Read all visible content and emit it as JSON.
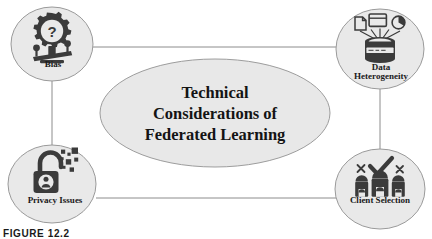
{
  "figure": {
    "caption": "FIGURE 12.2",
    "center": {
      "line1": "Technical",
      "line2": "Considerations of",
      "line3": "Federated Learning"
    },
    "nodes": [
      {
        "id": "bias",
        "label": "Bias",
        "icon": "gear-question-balance-scale-icon"
      },
      {
        "id": "data-heterogeneity",
        "label": "Data\nHeterogeneity",
        "icon": "database-documents-icon"
      },
      {
        "id": "privacy-issues",
        "label": "Privacy Issues",
        "icon": "open-padlock-pixels-icon"
      },
      {
        "id": "client-selection",
        "label": "Client Selection",
        "icon": "people-check-cross-icon"
      }
    ],
    "connections": [
      {
        "from": "bias",
        "to": "data-heterogeneity"
      },
      {
        "from": "bias",
        "to": "privacy-issues"
      },
      {
        "from": "data-heterogeneity",
        "to": "client-selection"
      },
      {
        "from": "privacy-issues",
        "to": "client-selection"
      }
    ],
    "colors": {
      "node_fill": "#e9e9e9",
      "node_stroke": "#9a9a9a",
      "center_fill": "#e8e8e8",
      "center_stroke": "#9a9a9a",
      "connector": "#8c8c8c",
      "icon": "#3b3b3b",
      "text": "#141414",
      "background": "#ffffff"
    }
  }
}
